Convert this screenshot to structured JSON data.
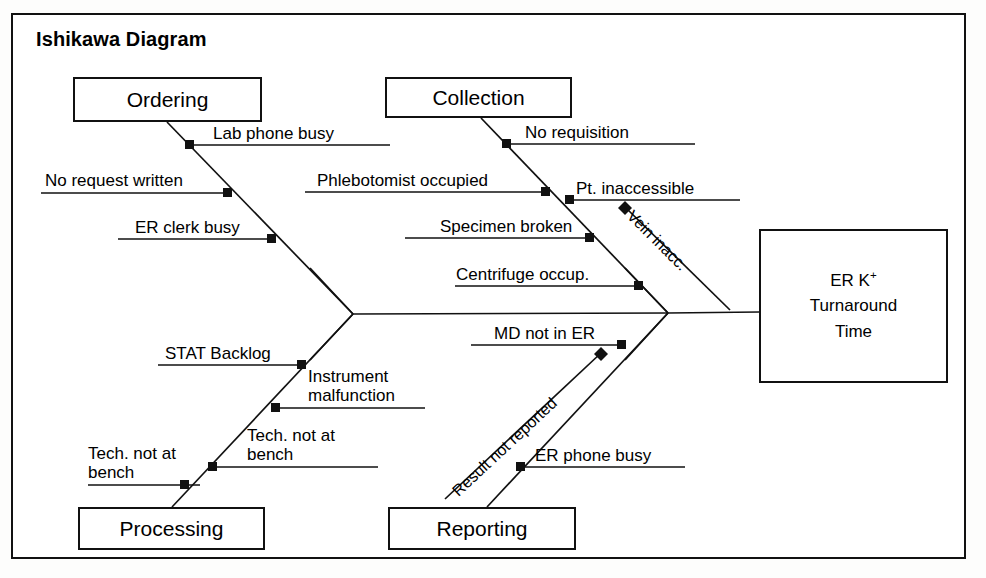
{
  "diagram": {
    "title": "Ishikawa Diagram",
    "type": "ishikawa-fishbone",
    "effect": {
      "line1_prefix": "ER K",
      "line1_sup": "+",
      "line2": "Turnaround",
      "line3": "Time"
    },
    "categories": [
      {
        "id": "ordering",
        "label": "Ordering",
        "position": "top-left",
        "causes": [
          {
            "label": "Lab phone busy",
            "side": "right",
            "marker": "square"
          },
          {
            "label": "No request written",
            "side": "left",
            "marker": "square"
          },
          {
            "label": "ER clerk busy",
            "side": "left",
            "marker": "square"
          }
        ]
      },
      {
        "id": "collection",
        "label": "Collection",
        "position": "top-right",
        "causes": [
          {
            "label": "No requisition",
            "side": "right",
            "marker": "square"
          },
          {
            "label": "Phlebotomist occupied",
            "side": "left",
            "marker": "square"
          },
          {
            "label": "Pt. inaccessible",
            "side": "right",
            "marker": "square"
          },
          {
            "label": "Specimen broken",
            "side": "left",
            "marker": "square"
          },
          {
            "label": "Centrifuge occup.",
            "side": "left",
            "marker": "square"
          }
        ],
        "sub_causes": [
          {
            "label": "Vein inacc.",
            "parent": "Pt. inaccessible",
            "marker": "diamond"
          }
        ]
      },
      {
        "id": "processing",
        "label": "Processing",
        "position": "bottom-left",
        "causes": [
          {
            "label": "STAT Backlog",
            "side": "left",
            "marker": "square"
          },
          {
            "label": "Instrument malfunction",
            "side": "right",
            "marker": "square"
          },
          {
            "label": "Unacceptable specs",
            "side": "right",
            "marker": "square"
          },
          {
            "label": "Tech. not at bench",
            "side": "left",
            "marker": "square"
          }
        ]
      },
      {
        "id": "reporting",
        "label": "Reporting",
        "position": "bottom-right",
        "causes": [
          {
            "label": "MD not in ER",
            "side": "left",
            "marker": "square"
          },
          {
            "label": "ER phone busy",
            "side": "right",
            "marker": "square"
          }
        ],
        "sub_causes": [
          {
            "label": "Result not reported",
            "parent": "MD not in ER",
            "marker": "diamond"
          }
        ]
      }
    ]
  },
  "colors": {
    "line": "#111111",
    "text": "#000000",
    "background": "#ffffff"
  }
}
